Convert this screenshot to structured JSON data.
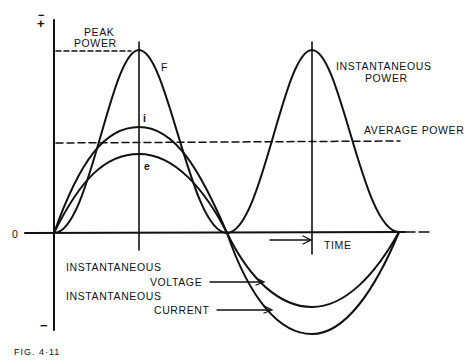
{
  "figure": {
    "caption": "FIG. 4·11",
    "axis": {
      "plus_symbol": "+",
      "minus_symbol": "−",
      "top_minus_symbol": "−",
      "zero_label": "0",
      "time_label": "TIME"
    },
    "labels": {
      "peak_power_line1": "PEAK",
      "peak_power_line2": "POWER",
      "power_curve_letter": "F",
      "current_curve_letter": "i",
      "voltage_curve_letter": "e",
      "instantaneous_power_line1": "INSTANTANEOUS",
      "instantaneous_power_line2": "POWER",
      "average_power": "AVERAGE POWER",
      "instantaneous_voltage_line1": "INSTANTANEOUS",
      "instantaneous_voltage_line2": "VOLTAGE",
      "instantaneous_current_line1": "INSTANTANEOUS",
      "instantaneous_current_line2": "CURRENT"
    },
    "geometry": {
      "origin_x": 54,
      "zero_y": 233,
      "half_cycle_end_x": 227,
      "cycle_end_x": 399,
      "first_peak_x": 139,
      "second_peak_x": 312,
      "peak_power_y": 50,
      "current_peak_y": 127,
      "voltage_peak_y": 154,
      "average_power_y": 142,
      "voltage_trough_y": 307,
      "current_trough_y": 334
    },
    "colors": {
      "ink": "#111111",
      "paper": "#ffffff"
    }
  }
}
